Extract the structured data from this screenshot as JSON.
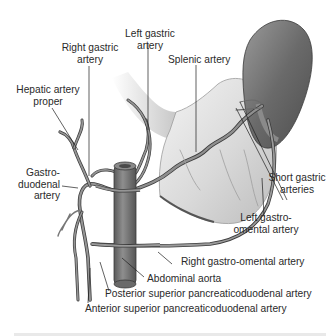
{
  "diagram": {
    "colors": {
      "artery": "#8a8a8a",
      "artery_outline": "#3c3c3c",
      "stomach_fill": "#dcdcdc",
      "spleen_fill": "#6e6e6e",
      "aorta_fill": "#7a7a7a",
      "leader_line": "#1e1e1e",
      "label_text": "#2a2a2a"
    },
    "labels": {
      "left_gastric": [
        "Left gastric",
        "artery"
      ],
      "right_gastric": [
        "Right gastric",
        "artery"
      ],
      "splenic": "Splenic artery",
      "hepatic_proper": [
        "Hepatic artery",
        "proper"
      ],
      "gastroduodenal": [
        "Gastro-",
        "duodenal",
        "artery"
      ],
      "short_gastric": [
        "Short gastric",
        "arteries"
      ],
      "left_gastro_omental": [
        "Left gastro-",
        "omental artery"
      ],
      "right_gastro_omental": "Right gastro-omental artery",
      "abdominal_aorta": "Abdominal aorta",
      "posterior_sup_pd": "Posterior superior pancreaticoduodenal artery",
      "anterior_sup_pd": "Anterior superior pancreaticoduodenal artery"
    }
  }
}
